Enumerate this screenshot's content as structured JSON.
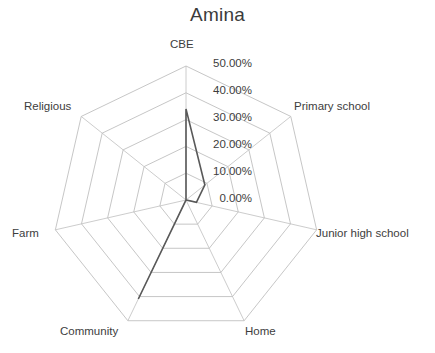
{
  "chart_data": {
    "type": "radar",
    "title": "Amina",
    "categories": [
      "CBE",
      "Primary school",
      "Junior high school",
      "Home",
      "Community",
      "Farm",
      "Religious"
    ],
    "values": [
      34.0,
      9.0,
      4.0,
      0.0,
      41.0,
      0.0,
      0.0
    ],
    "series": [
      {
        "name": "Amina",
        "values": [
          34.0,
          9.0,
          4.0,
          0.0,
          41.0,
          0.0,
          0.0
        ],
        "color": "#595959"
      }
    ],
    "tick_labels": [
      "0.00%",
      "10.00%",
      "20.00%",
      "30.00%",
      "40.00%",
      "50.00%"
    ],
    "tick_values": [
      0,
      10,
      20,
      30,
      40,
      50
    ],
    "rlim": [
      0,
      50
    ],
    "grid": true,
    "grid_color": "#bfbfbf",
    "legend": false,
    "xlabel": "",
    "ylabel": ""
  },
  "geometry": {
    "center_x": 186,
    "center_y": 200,
    "radius": 134,
    "start_angle_deg": -90,
    "rings": 5
  },
  "axis_label_positions": [
    {
      "label": "CBE",
      "left": 170,
      "top": 38
    },
    {
      "label": "Primary school",
      "left": 294,
      "top": 100
    },
    {
      "label": "Junior high school",
      "left": 316,
      "top": 227
    },
    {
      "label": "Home",
      "left": 245,
      "top": 325
    },
    {
      "label": "Community",
      "left": 60,
      "top": 325
    },
    {
      "label": "Farm",
      "left": 12,
      "top": 227
    },
    {
      "label": "Religious",
      "left": 24,
      "top": 100
    }
  ],
  "tick_label_positions": [
    {
      "label": "0.00%",
      "right": 252,
      "top": 192
    },
    {
      "label": "10.00%",
      "right": 252,
      "top": 165
    },
    {
      "label": "20.00%",
      "right": 252,
      "top": 138
    },
    {
      "label": "30.00%",
      "right": 252,
      "top": 111
    },
    {
      "label": "40.00%",
      "right": 252,
      "top": 84
    },
    {
      "label": "50.00%",
      "right": 252,
      "top": 57
    }
  ]
}
